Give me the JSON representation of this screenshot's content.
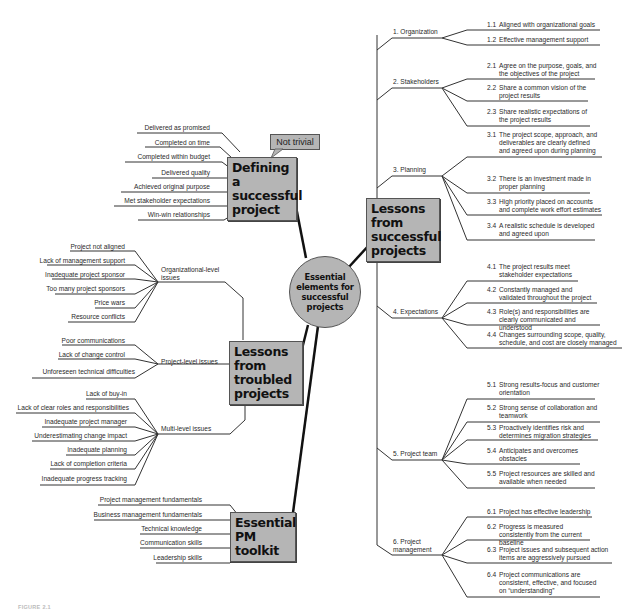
{
  "hub": {
    "label": "Essential elements for successful projects"
  },
  "callout": {
    "label": "Not trivial"
  },
  "defining": {
    "title": "Defining a successful project",
    "items": [
      "Delivered as promised",
      "Completed on time",
      "Completed within budget",
      "Delivered quality",
      "Achieved original purpose",
      "Met stakeholder expectations",
      "Win-win relationships"
    ]
  },
  "troubled": {
    "title": "Lessons from troubled projects",
    "groups": [
      {
        "label": "Organizational-level issues",
        "items": [
          "Project not aligned",
          "Lack of management support",
          "Inadequate project sponsor",
          "Too many project sponsors",
          "Price wars",
          "Resource conflicts"
        ]
      },
      {
        "label": "Project-level issues",
        "items": [
          "Poor communications",
          "Lack of change control",
          "Unforeseen technical difficulties"
        ]
      },
      {
        "label": "Multi-level issues",
        "items": [
          "Lack of buy-in",
          "Lack of clear roles and responsibilities",
          "Inadequate project manager",
          "Underestimating change impact",
          "Inadequate planning",
          "Lack of completion criteria",
          "Inadequate progress tracking"
        ]
      }
    ]
  },
  "toolkit": {
    "title": "Essential PM toolkit",
    "items": [
      "Project management fundamentals",
      "Business management fundamentals",
      "Technical knowledge",
      "Communication skills",
      "Leadership skills"
    ]
  },
  "successful": {
    "title": "Lessons from successful projects",
    "categories": [
      {
        "label": "1. Organization",
        "items": [
          {
            "num": "1.1",
            "text": "Aligned with organizational goals"
          },
          {
            "num": "1.2",
            "text": "Effective management support"
          }
        ]
      },
      {
        "label": "2. Stakeholders",
        "items": [
          {
            "num": "2.1",
            "text": "Agree on the purpose, goals, and the objectives of the project"
          },
          {
            "num": "2.2",
            "text": "Share a common vision of the project results"
          },
          {
            "num": "2.3",
            "text": "Share realistic expectations of the project results"
          }
        ]
      },
      {
        "label": "3. Planning",
        "items": [
          {
            "num": "3.1",
            "text": "The project scope, approach, and deliverables are clearly defined and agreed upon during planning"
          },
          {
            "num": "3.2",
            "text": "There is an investment made in proper planning"
          },
          {
            "num": "3.3",
            "text": "High priority placed on accounts and complete work effort estimates"
          },
          {
            "num": "3.4",
            "text": "A realistic schedule is developed and agreed upon"
          }
        ]
      },
      {
        "label": "4. Expectations",
        "items": [
          {
            "num": "4.1",
            "text": "The project results meet stakeholder expectations"
          },
          {
            "num": "4.2",
            "text": "Constantly managed and validated throughout the project"
          },
          {
            "num": "4.3",
            "text": "Role(s) and responsibilities are clearly communicated and understood"
          },
          {
            "num": "4.4",
            "text": "Changes surrounding scope, quality, schedule, and cost are closely managed"
          }
        ]
      },
      {
        "label": "5. Project team",
        "items": [
          {
            "num": "5.1",
            "text": "Strong results-focus and customer orientation"
          },
          {
            "num": "5.2",
            "text": "Strong sense of collaboration and teamwork"
          },
          {
            "num": "5.3",
            "text": "Proactively identifies risk and determines migration strategies"
          },
          {
            "num": "5.4",
            "text": "Anticipates and overcomes obstacles"
          },
          {
            "num": "5.5",
            "text": "Project resources are skilled and available when needed"
          }
        ]
      },
      {
        "label": "6. Project management",
        "items": [
          {
            "num": "6.1",
            "text": "Project has effective leadership"
          },
          {
            "num": "6.2",
            "text": "Progress is measured consistently from the current baseline"
          },
          {
            "num": "6.3",
            "text": "Project issues and subsequent action items are aggressively pursued"
          },
          {
            "num": "6.4",
            "text": "Project communications are consistent, effective, and focused on “understanding”"
          }
        ]
      }
    ]
  },
  "caption": {
    "label": "FIGURE 2.1"
  },
  "colors": {
    "box_fill": "#b5b5b5",
    "line": "#333333",
    "background": "#ffffff"
  }
}
